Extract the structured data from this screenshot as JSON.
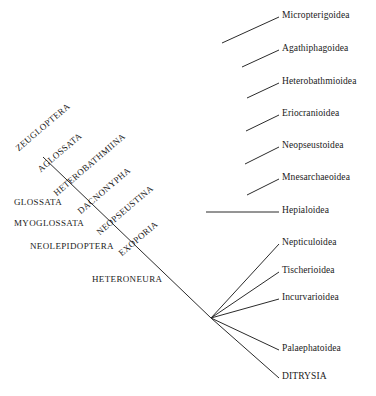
{
  "diagram": {
    "type": "phylogenetic-cladogram",
    "background_color": "#ffffff",
    "line_color": "#2b2b2b",
    "text_color": "#1a1a1a"
  },
  "tips": [
    {
      "label": "Micropterigoidea",
      "x": 282,
      "y": 16,
      "line_x1": 222,
      "line_y1": 43,
      "line_x2": 279,
      "line_y2": 17
    },
    {
      "label": "Agathiphagoidea",
      "x": 282,
      "y": 49,
      "line_x1": 242,
      "line_y1": 67,
      "line_x2": 279,
      "line_y2": 50
    },
    {
      "label": "Heterobathmioidea",
      "x": 282,
      "y": 82,
      "line_x1": 247,
      "line_y1": 98,
      "line_x2": 279,
      "line_y2": 83
    },
    {
      "label": "Eriocranioidea",
      "x": 282,
      "y": 114,
      "line_x1": 246,
      "line_y1": 131,
      "line_x2": 279,
      "line_y2": 115
    },
    {
      "label": "Neopseustoidea",
      "x": 282,
      "y": 146,
      "line_x1": 245,
      "line_y1": 164,
      "line_x2": 279,
      "line_y2": 147
    },
    {
      "label": "Mnesarchaeoidea",
      "x": 282,
      "y": 178,
      "line_x1": 247,
      "line_y1": 195,
      "line_x2": 279,
      "line_y2": 179
    },
    {
      "label": "Hepialoidea",
      "x": 282,
      "y": 211,
      "line_x1": 206,
      "line_y1": 212,
      "line_x2": 279,
      "line_y2": 212
    },
    {
      "label": "Nepticuloidea",
      "x": 282,
      "y": 243,
      "line_x1": 211,
      "line_y1": 318,
      "line_x2": 279,
      "line_y2": 244
    },
    {
      "label": "Tischerioidea",
      "x": 282,
      "y": 271,
      "line_x1": 211,
      "line_y1": 318,
      "line_x2": 279,
      "line_y2": 272
    },
    {
      "label": "Incurvarioidea",
      "x": 282,
      "y": 298,
      "line_x1": 211,
      "line_y1": 318,
      "line_x2": 279,
      "line_y2": 299
    },
    {
      "label": "Palaephatoidea",
      "x": 282,
      "y": 349,
      "line_x1": 211,
      "line_y1": 318,
      "line_x2": 279,
      "line_y2": 350
    },
    {
      "label": "DITRYSIA",
      "x": 282,
      "y": 377,
      "line_x1": 211,
      "line_y1": 318,
      "line_x2": 279,
      "line_y2": 378
    }
  ],
  "clades_rotated": [
    {
      "label": "ZEUGLOPTERA",
      "x": 20,
      "y": 143
    },
    {
      "label": "AGLOSSATA",
      "x": 42,
      "y": 164
    },
    {
      "label": "HETEROBATHMIINA",
      "x": 58,
      "y": 188
    },
    {
      "label": "DACNONYPHA",
      "x": 82,
      "y": 206
    },
    {
      "label": "NEOPSEUSTINA",
      "x": 101,
      "y": 227
    },
    {
      "label": "EXOPORIA",
      "x": 123,
      "y": 248
    }
  ],
  "clades_horizontal": [
    {
      "label": "GLOSSATA",
      "x": 14,
      "y": 203
    },
    {
      "label": "MYOGLOSSATA",
      "x": 14,
      "y": 224
    },
    {
      "label": "NEOLEPIDOPTERA",
      "x": 30,
      "y": 247
    },
    {
      "label": "HETERONEURA",
      "x": 92,
      "y": 280
    }
  ],
  "backbone": {
    "points": "43,157 211,318",
    "nodes": [
      {
        "name": "root",
        "x": 43,
        "y": 157
      },
      {
        "name": "aglossata-node",
        "x": 63,
        "y": 176
      },
      {
        "name": "glossata-node",
        "x": 82,
        "y": 195
      },
      {
        "name": "myoglossata-node",
        "x": 101,
        "y": 213
      },
      {
        "name": "neolepidoptera-node",
        "x": 120,
        "y": 232
      },
      {
        "name": "exoporia-node",
        "x": 140,
        "y": 251
      },
      {
        "name": "heteroneura-node",
        "x": 159,
        "y": 270
      },
      {
        "name": "polytomy-node",
        "x": 211,
        "y": 318
      }
    ]
  }
}
